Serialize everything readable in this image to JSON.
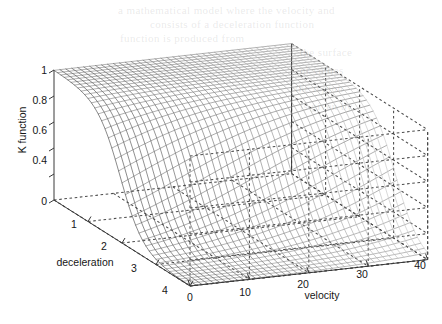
{
  "figure": {
    "title": "",
    "background_color": "#ffffff",
    "mesh_color": "#404040",
    "axis_color": "#3a3a3a",
    "grid_color": "#4a4a4a"
  },
  "axes": {
    "x": {
      "name": "velocity",
      "label": "velocity",
      "ticks": [
        "0",
        "10",
        "20",
        "30",
        "40"
      ],
      "tick_values": [
        0,
        10,
        20,
        30,
        40
      ],
      "range": [
        0,
        40
      ]
    },
    "y": {
      "name": "deceleration",
      "label": "deceleration",
      "ticks": [
        "0",
        "1",
        "2",
        "3",
        "4"
      ],
      "tick_values": [
        0,
        1,
        2,
        3,
        4
      ],
      "range": [
        0,
        4
      ]
    },
    "z": {
      "name": "K function",
      "label": "K function",
      "ticks": [
        "0",
        "",
        "0.4",
        "0.6",
        "0.8",
        "1"
      ],
      "tick_values": [
        0,
        0.2,
        0.4,
        0.6,
        0.8,
        1
      ],
      "range": [
        0,
        1
      ]
    }
  },
  "chart_data": {
    "type": "surface",
    "title": "",
    "xlabel": "velocity",
    "ylabel": "deceleration",
    "zlabel": "K function",
    "xlim": [
      0,
      40
    ],
    "ylim": [
      0,
      4
    ],
    "zlim": [
      0,
      1
    ],
    "grid": true,
    "legend": "none",
    "style": "matlab-mesh",
    "x": [
      0,
      4,
      8,
      12,
      16,
      20,
      24,
      28,
      32,
      36,
      40
    ],
    "y": [
      0,
      0.4,
      0.8,
      1.2,
      1.6,
      2.0,
      2.4,
      2.8,
      3.2,
      3.6,
      4.0
    ],
    "z_rows": [
      [
        1.0,
        1.0,
        1.0,
        1.0,
        1.0,
        1.0,
        1.0,
        1.0,
        1.0,
        1.0,
        1.0
      ],
      [
        0.99,
        0.99,
        0.99,
        0.99,
        0.99,
        1.0,
        1.0,
        1.0,
        1.0,
        1.0,
        1.0
      ],
      [
        0.96,
        0.96,
        0.97,
        0.97,
        0.98,
        0.98,
        0.99,
        0.99,
        0.99,
        0.99,
        1.0
      ],
      [
        0.88,
        0.89,
        0.9,
        0.92,
        0.93,
        0.95,
        0.96,
        0.97,
        0.98,
        0.98,
        0.99
      ],
      [
        0.68,
        0.71,
        0.74,
        0.78,
        0.82,
        0.85,
        0.88,
        0.91,
        0.93,
        0.95,
        0.96
      ],
      [
        0.4,
        0.43,
        0.47,
        0.53,
        0.59,
        0.65,
        0.71,
        0.76,
        0.81,
        0.85,
        0.88
      ],
      [
        0.18,
        0.2,
        0.23,
        0.28,
        0.33,
        0.4,
        0.47,
        0.54,
        0.61,
        0.68,
        0.74
      ],
      [
        0.07,
        0.08,
        0.1,
        0.12,
        0.15,
        0.19,
        0.24,
        0.3,
        0.37,
        0.44,
        0.52
      ],
      [
        0.03,
        0.03,
        0.04,
        0.05,
        0.06,
        0.08,
        0.11,
        0.14,
        0.18,
        0.23,
        0.29
      ],
      [
        0.01,
        0.01,
        0.01,
        0.02,
        0.02,
        0.03,
        0.04,
        0.06,
        0.08,
        0.11,
        0.14
      ],
      [
        0.0,
        0.0,
        0.0,
        0.01,
        0.01,
        0.01,
        0.02,
        0.02,
        0.03,
        0.05,
        0.06
      ]
    ],
    "mesh_resolution": {
      "nx": 41,
      "ny": 41
    },
    "surface_model": {
      "form": "K = 1 / (1 + exp((d - d0(v)) / s))",
      "d0_at_v0": 1.95,
      "d0_at_vmax": 3.05,
      "smoothness": 0.33
    }
  },
  "view": {
    "azimuth_note": "standard MATLAB view(-37.5,30)",
    "box": true
  },
  "scan_artifacts": [
    "text bleed-through from reverse page (illegible)"
  ]
}
